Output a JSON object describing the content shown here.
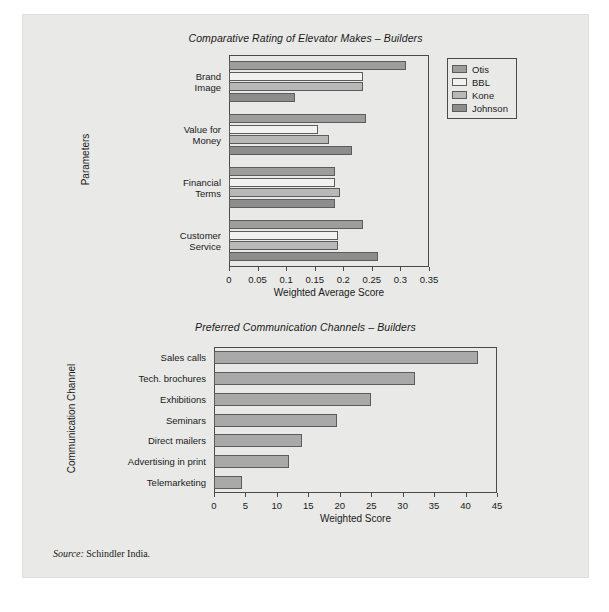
{
  "source_note": {
    "label": "Source:",
    "text": "Schindler India."
  },
  "chart_data": [
    {
      "type": "bar",
      "orientation": "horizontal",
      "title": "Comparative Rating of Elevator Makes – Builders",
      "xlabel": "Weighted Average Score",
      "ylabel": "Parameters",
      "xlim": [
        0,
        0.35
      ],
      "xticks": [
        "0",
        "0.05",
        "0.1",
        "0.15",
        "0.2",
        "0.25",
        "0.3",
        "0.35"
      ],
      "xtick_values": [
        0,
        0.05,
        0.1,
        0.15,
        0.2,
        0.25,
        0.3,
        0.35
      ],
      "grid": false,
      "legend_position": "right",
      "categories": [
        "Brand\nImage",
        "Value for\nMoney",
        "Financial\nTerms",
        "Customer\nService"
      ],
      "series": [
        {
          "name": "Otis",
          "color": "#9d9d9d",
          "values": [
            0.31,
            0.24,
            0.185,
            0.235
          ]
        },
        {
          "name": "BBL",
          "color": "#f2f2f0",
          "values": [
            0.235,
            0.155,
            0.185,
            0.19
          ]
        },
        {
          "name": "Kone",
          "color": "#b8b8b8",
          "values": [
            0.235,
            0.175,
            0.195,
            0.19
          ]
        },
        {
          "name": "Johnson",
          "color": "#8d8d8d",
          "values": [
            0.115,
            0.215,
            0.185,
            0.26
          ]
        }
      ]
    },
    {
      "type": "bar",
      "orientation": "horizontal",
      "title": "Preferred Communication Channels – Builders",
      "xlabel": "Weighted Score",
      "ylabel": "Communication Channel",
      "xlim": [
        0,
        45
      ],
      "xticks": [
        "0",
        "5",
        "10",
        "15",
        "20",
        "25",
        "30",
        "35",
        "40",
        "45"
      ],
      "xtick_values": [
        0,
        5,
        10,
        15,
        20,
        25,
        30,
        35,
        40,
        45
      ],
      "grid": false,
      "legend_position": "none",
      "bar_color": "#a9a9a9",
      "categories": [
        "Sales calls",
        "Tech. brochures",
        "Exhibitions",
        "Seminars",
        "Direct mailers",
        "Advertising in print",
        "Telemarketing"
      ],
      "values": [
        42,
        32,
        25,
        19.5,
        14,
        12,
        4.5
      ]
    }
  ]
}
